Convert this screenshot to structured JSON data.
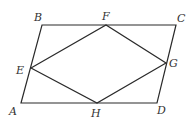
{
  "diagram": {
    "type": "geometry",
    "stroke_color": "#2a2a2a",
    "points": {
      "A": {
        "label": "A",
        "x": 21,
        "y": 103
      },
      "B": {
        "label": "B",
        "x": 42,
        "y": 25
      },
      "C": {
        "label": "C",
        "x": 176,
        "y": 25
      },
      "D": {
        "label": "D",
        "x": 157,
        "y": 103
      },
      "E": {
        "label": "E",
        "x": 31,
        "y": 68
      },
      "F": {
        "label": "F",
        "x": 106,
        "y": 25
      },
      "G": {
        "label": "G",
        "x": 166,
        "y": 63
      },
      "H": {
        "label": "H",
        "x": 97,
        "y": 103
      }
    },
    "segments": [
      [
        "A",
        "B"
      ],
      [
        "B",
        "C"
      ],
      [
        "C",
        "D"
      ],
      [
        "D",
        "A"
      ],
      [
        "E",
        "F"
      ],
      [
        "F",
        "G"
      ],
      [
        "G",
        "H"
      ],
      [
        "H",
        "E"
      ]
    ]
  }
}
